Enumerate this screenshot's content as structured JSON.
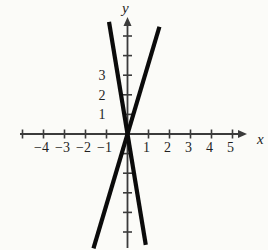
{
  "figure": {
    "colors": {
      "background": "#fbfbf8",
      "axis": "#3b3b3b",
      "tick": "#3b3b3b",
      "text": "#1f1f1f",
      "line": "#0b0b0b"
    }
  },
  "chart_data": {
    "type": "line",
    "title": "",
    "xlabel": "x",
    "ylabel": "y",
    "xlim": [
      -5.5,
      6
    ],
    "ylim": [
      -6.2,
      6.3
    ],
    "grid": false,
    "legend": false,
    "x_ticks": [
      -5,
      -4,
      -3,
      -2,
      -1,
      1,
      2,
      3,
      4,
      5
    ],
    "x_labeled_ticks": [
      -4,
      -3,
      -2,
      -1,
      1,
      2,
      3,
      4,
      5
    ],
    "x_tick_labels": [
      "−4",
      "−3",
      "−2",
      "−1",
      "1",
      "2",
      "3",
      "4",
      "5"
    ],
    "y_ticks": [
      -5,
      -4,
      -3,
      -2,
      -1,
      1,
      2,
      3,
      4,
      5
    ],
    "y_labeled_ticks": [
      1,
      2,
      3
    ],
    "y_tick_labels": [
      "1",
      "2",
      "3"
    ],
    "series": [
      {
        "name": "steep negative-slope line",
        "slope": -6.5,
        "intercept": 0,
        "x_range": [
          -0.88,
          0.87
        ]
      },
      {
        "name": "steep positive-slope line",
        "slope": 3.6,
        "intercept": 0,
        "x_range": [
          -1.62,
          1.52
        ]
      }
    ],
    "intersection_point": [
      0,
      0
    ]
  }
}
